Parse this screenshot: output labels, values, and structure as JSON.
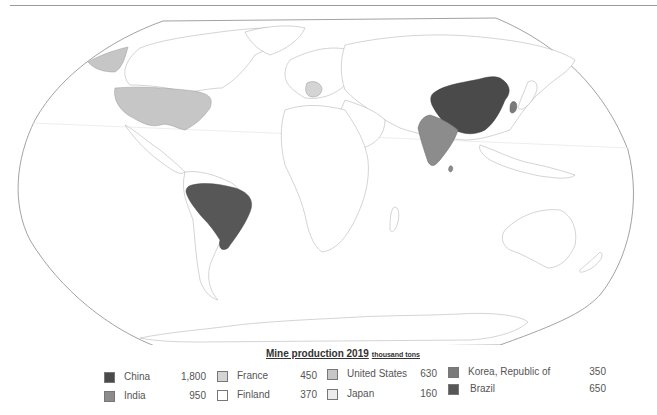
{
  "legend": {
    "title": "Mine production 2019",
    "unit": "thousand tons",
    "items": [
      {
        "name": "China",
        "value": "1,800",
        "color": "#4a4a4a"
      },
      {
        "name": "India",
        "value": "950",
        "color": "#8c8c8c"
      },
      {
        "name": "France",
        "value": "450",
        "color": "#d4d4d4"
      },
      {
        "name": "Finland",
        "value": "370",
        "color": "#ffffff"
      },
      {
        "name": "United States",
        "value": "630",
        "color": "#c6c6c6"
      },
      {
        "name": "Japan",
        "value": "160",
        "color": "#ececec"
      },
      {
        "name": "Korea, Republic of",
        "value": "350",
        "color": "#7a7a7a"
      },
      {
        "name": "Brazil",
        "value": "650",
        "color": "#575757"
      }
    ]
  },
  "map": {
    "projection": "Robinson-style world map",
    "highlighted": [
      "China",
      "India",
      "France",
      "United States",
      "Korea, Republic of",
      "Brazil",
      "Japan",
      "Finland"
    ]
  }
}
